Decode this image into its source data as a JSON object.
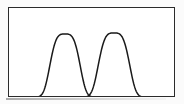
{
  "figure": {
    "title": "",
    "frame": {
      "x": 8,
      "y": 7,
      "width": 167,
      "height": 90,
      "border_color": "#2b2b2b",
      "border_width": 1.4,
      "background": "#ffffff"
    },
    "background_color": "#fbfbfb",
    "curve_color": "#1a1a1a",
    "curve_stroke_width": 1.5
  },
  "chart_data": {
    "type": "line",
    "title": "",
    "subtitle": "",
    "xlabel": "",
    "ylabel": "",
    "xlim": [
      0,
      167
    ],
    "ylim": [
      0,
      90
    ],
    "grid": false,
    "legend": "none",
    "axis_ticks": false,
    "axis_tick_labels": [],
    "annotations": [],
    "series": [
      {
        "name": "left-curve",
        "shape": "super-gaussian",
        "peak_x": 56,
        "peak_y": 26,
        "baseline_y": 89,
        "amplitude": 63,
        "left_foot_x": 30,
        "right_foot_x": 86,
        "flat_top_half_width": 9,
        "x": [
          28,
          32,
          36,
          40,
          44,
          48,
          52,
          56,
          60,
          64,
          68,
          72,
          76,
          80,
          84
        ],
        "y": [
          89,
          88,
          84,
          72,
          52,
          34,
          27,
          25,
          25,
          27,
          34,
          52,
          72,
          84,
          88
        ]
      },
      {
        "name": "right-curve",
        "shape": "super-gaussian",
        "peak_x": 105,
        "peak_y": 25,
        "baseline_y": 89,
        "amplitude": 64,
        "left_foot_x": 78,
        "right_foot_x": 136,
        "flat_top_half_width": 9,
        "x": [
          77,
          81,
          85,
          89,
          93,
          97,
          101,
          105,
          109,
          113,
          117,
          121,
          125,
          129,
          133
        ],
        "y": [
          89,
          88,
          84,
          71,
          50,
          32,
          26,
          24,
          24,
          26,
          32,
          50,
          71,
          84,
          88
        ]
      }
    ],
    "crossing_points": [
      {
        "x": 81,
        "y": 86
      }
    ],
    "baseline": {
      "name": "baseline",
      "y": 89,
      "x_start": 0,
      "x_end": 167
    }
  }
}
